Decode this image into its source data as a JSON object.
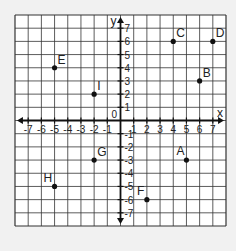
{
  "chart_data": {
    "type": "scatter",
    "title": "",
    "xlabel": "x",
    "ylabel": "y",
    "xlim": [
      -8,
      8
    ],
    "ylim": [
      -8,
      8
    ],
    "grid": true,
    "origin_label": "0",
    "x_ticks": [
      -7,
      -6,
      -5,
      -4,
      -3,
      -2,
      -1,
      1,
      2,
      3,
      4,
      5,
      6,
      7
    ],
    "y_ticks": [
      7,
      6,
      5,
      4,
      3,
      2,
      1,
      -1,
      -2,
      -3,
      -4,
      -5,
      -6,
      -7
    ],
    "points": [
      {
        "label": "A",
        "x": 5,
        "y": -3
      },
      {
        "label": "B",
        "x": 6,
        "y": 3
      },
      {
        "label": "C",
        "x": 4,
        "y": 6
      },
      {
        "label": "D",
        "x": 7,
        "y": 6
      },
      {
        "label": "E",
        "x": -5,
        "y": 4
      },
      {
        "label": "F",
        "x": 2,
        "y": -6
      },
      {
        "label": "G",
        "x": -2,
        "y": -3
      },
      {
        "label": "H",
        "x": -5,
        "y": -5
      },
      {
        "label": "I",
        "x": -2,
        "y": 2
      }
    ]
  },
  "colors": {
    "background": "#f1f1f1",
    "grid_fill": "#ffffff",
    "grid_line": "#333333",
    "axis": "#111111",
    "point": "#111111"
  }
}
